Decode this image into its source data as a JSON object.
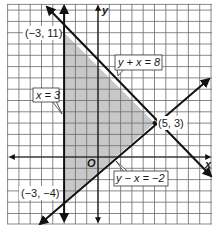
{
  "figure": {
    "type": "graph-of-system-of-inequalities",
    "axes": {
      "x_label": "x",
      "y_label": "y",
      "origin_label": "O"
    },
    "grid": {
      "x_min": -8,
      "x_max": 10,
      "y_min": -6,
      "y_max": 13,
      "step": 1
    },
    "lines": [
      {
        "id": "line-x-eq-3",
        "label": "x = 3",
        "equation": "x = -3"
      },
      {
        "id": "line-y-plus-x-eq-8",
        "label": "y + x = 8",
        "equation": "y = 8 - x"
      },
      {
        "id": "line-y-minus-x-eq-neg2",
        "label": "y − x = −2",
        "equation": "y = x - 2"
      }
    ],
    "vertices": [
      {
        "label": "(−3, 11)",
        "x": -3,
        "y": 11
      },
      {
        "label": "(5, 3)",
        "x": 5,
        "y": 3
      },
      {
        "label": "(−3, −4)",
        "x": -3,
        "y": -4
      }
    ],
    "shaded_region": "triangle bounded by the three lines",
    "colors": {
      "grid": "#5a5a5a",
      "shade": "#c8c8c8",
      "line": "#111111",
      "background": "#ffffff"
    }
  }
}
